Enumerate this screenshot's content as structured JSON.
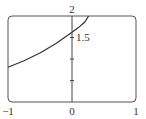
{
  "chart_data": {
    "type": "line",
    "title": "",
    "xlabel": "",
    "ylabel": "",
    "xlim": [
      -1,
      1
    ],
    "ylim": [
      0,
      2
    ],
    "grid": false,
    "legend": null,
    "x_ticks": [
      -1,
      0,
      1
    ],
    "x_tick_labels": [
      "−1",
      "0",
      "1"
    ],
    "y_ticks": [
      0.5,
      1,
      1.5,
      2
    ],
    "y_tick_labels": {
      "1.5": "1.5",
      "2": "2"
    },
    "series": [
      {
        "name": "curve",
        "x": [
          -1.0,
          -0.75,
          -0.5,
          -0.25,
          0.0,
          0.1,
          0.2,
          0.26
        ],
        "y": [
          0.81,
          0.96,
          1.14,
          1.36,
          1.62,
          1.73,
          1.86,
          2.0
        ]
      }
    ]
  },
  "labels": {
    "x_min": "−1",
    "x_zero": "0",
    "x_max": "1",
    "y_top": "2",
    "y_mid": "1.5"
  },
  "colors": {
    "curve": "#333333",
    "frame": "#555555",
    "axis": "#444444"
  }
}
